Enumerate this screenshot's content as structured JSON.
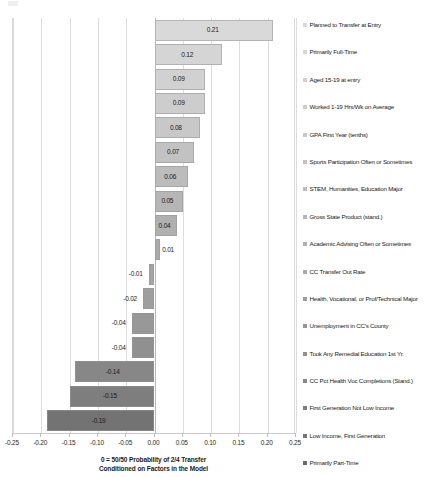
{
  "chart_data": {
    "type": "bar",
    "orientation": "horizontal",
    "title": "",
    "xlabel": "0 = 50/50 Probability of 2/4 Transfer\nConditioned on Factors in the Model",
    "xlabel_line1": "0 = 50/50 Probability of 2/4 Transfer",
    "xlabel_line2": "Conditioned on Factors in the Model",
    "ylabel": "",
    "xlim": [
      -0.25,
      0.25
    ],
    "xticks": [
      -0.25,
      -0.2,
      -0.15,
      -0.1,
      -0.05,
      0.0,
      0.05,
      0.1,
      0.15,
      0.2,
      0.25
    ],
    "xticklabels": [
      "-0.25",
      "-0.20",
      "-0.15",
      "-0.10",
      "-0.05",
      "0.00",
      "0.05",
      "0.10",
      "0.15",
      "0.20",
      "0.25"
    ],
    "grid": "vertical",
    "legend_position": "right",
    "categories": [
      "Planned to Transfer at Entry",
      "Primarily Full-Time",
      "Aged 15-19 at entry",
      "Worked 1-19 Hrs/Wk on Average",
      "GPA First Year (tenths)",
      "Sports Participation Often or Sometimes",
      "STEM, Humanities, Education Major",
      "Gross State Product (stand.)",
      "Academic Advising Often or Sometimes",
      "CC Transfer Out Rate",
      "Health, Vocational, or Prof/Technical Major",
      "Unemployment in CC's County",
      "Took Any Remedial Education 1st Yr.",
      "CC Pct Health Voc Completions (Stand.)",
      "First Generation Not Low Income",
      "Low Income, First Generation",
      "Primarily Part-Time"
    ],
    "values": [
      0.21,
      0.12,
      0.09,
      0.09,
      0.08,
      0.07,
      0.06,
      0.05,
      0.04,
      0.01,
      -0.01,
      -0.02,
      -0.04,
      -0.04,
      -0.14,
      -0.15,
      -0.19
    ],
    "bar_labels": [
      "0.21",
      "0.12",
      "0.09",
      "0.09",
      "0.08",
      "0.07",
      "0.06",
      "0.05",
      "0.04",
      "0.01",
      "-0.01",
      "-0.02",
      "-0.04",
      "-0.04",
      "-0.14",
      "-0.15",
      "-0.19"
    ],
    "colors": [
      "#d9d9d9",
      "#d5d5d5",
      "#d1d1d1",
      "#cdcdcd",
      "#c8c8c8",
      "#c2c2c2",
      "#bcbcbc",
      "#b6b6b6",
      "#b0b0b0",
      "#aaaaaa",
      "#a4a4a4",
      "#9e9e9e",
      "#989898",
      "#909090",
      "#878787",
      "#7e7e7e",
      "#737373"
    ]
  },
  "legend": {
    "items": [
      {
        "label": "Planned to Transfer at Entry",
        "color": "#d9d9d9"
      },
      {
        "label": "Primarily Full-Time",
        "color": "#d5d5d5"
      },
      {
        "label": "Aged 15-19 at entry",
        "color": "#d1d1d1"
      },
      {
        "label": "Worked 1-19 Hrs/Wk on Average",
        "color": "#cdcdcd"
      },
      {
        "label": "GPA First Year (tenths)",
        "color": "#c8c8c8"
      },
      {
        "label": "Sports Participation Often or Sometimes",
        "color": "#c2c2c2"
      },
      {
        "label": "STEM, Humanities, Education Major",
        "color": "#bcbcbc"
      },
      {
        "label": "Gross State Product (stand.)",
        "color": "#b6b6b6"
      },
      {
        "label": "Academic Advising Often or Sometimes",
        "color": "#b0b0b0"
      },
      {
        "label": "CC Transfer Out Rate",
        "color": "#aaaaaa"
      },
      {
        "label": "Health, Vocational, or Prof/Technical Major",
        "color": "#9e9e9e"
      },
      {
        "label": "Unemployment in CC's County",
        "color": "#989898"
      },
      {
        "label": "Took Any Remedial Education 1st Yr.",
        "color": "#909090"
      },
      {
        "label": "CC Pct Health Voc Completions (Stand.)",
        "color": "#878787"
      },
      {
        "label": "First Generation Not Low Income",
        "color": "#7e7e7e"
      },
      {
        "label": "Low Income, First Generation",
        "color": "#757575"
      },
      {
        "label": "Primarily Part-Time",
        "color": "#6b6b6b"
      }
    ]
  }
}
